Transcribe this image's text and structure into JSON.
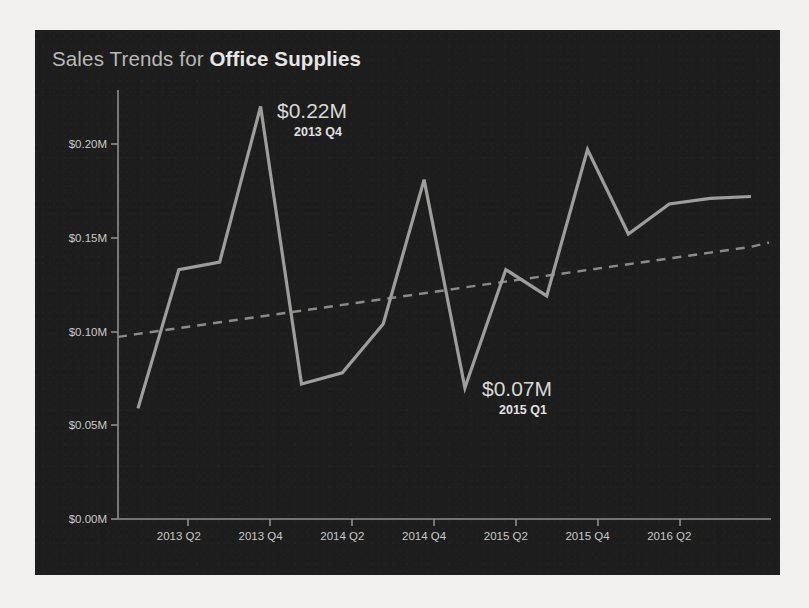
{
  "page": {
    "background_color": "#f1f0ee",
    "panel_color": "#1d1d1d"
  },
  "header": {
    "title_prefix": "Sales Trends for ",
    "title_category": "Office Supplies"
  },
  "colors": {
    "line": "#9d9d9b",
    "trend": "#8a8a88",
    "axis": "#8e8e8c",
    "text": "#c9c9c7",
    "title": "#b9b9b7"
  },
  "annotations": [
    {
      "name": "peak-annotation",
      "value_label": "$0.22M",
      "period_label": "2013 Q4",
      "x": 277,
      "y": 100
    },
    {
      "name": "low-annotation",
      "value_label": "$0.07M",
      "period_label": "2015 Q1",
      "x": 482,
      "y": 378
    }
  ],
  "chart_data": {
    "type": "line",
    "title": "Sales Trends for Office Supplies",
    "xlabel": "",
    "ylabel": "",
    "ylim": [
      0,
      0.225
    ],
    "ytick_values": [
      0.0,
      0.05,
      0.1,
      0.15,
      0.2
    ],
    "ytick_labels": [
      "$0.00M",
      "$0.05M",
      "$0.10M",
      "$0.15M",
      "$0.20M"
    ],
    "xtick_labels": [
      "2013 Q2",
      "2013 Q4",
      "2014 Q2",
      "2014 Q4",
      "2015 Q2",
      "2015 Q4",
      "2016 Q2"
    ],
    "x": [
      "2013 Q1",
      "2013 Q2",
      "2013 Q3",
      "2013 Q4",
      "2014 Q1",
      "2014 Q2",
      "2014 Q3",
      "2014 Q4",
      "2015 Q1",
      "2015 Q2",
      "2015 Q3",
      "2015 Q4",
      "2016 Q1",
      "2016 Q2",
      "2016 Q3",
      "2016 Q4"
    ],
    "series": [
      {
        "name": "Sales",
        "style": "solid",
        "values": [
          0.059,
          0.133,
          0.137,
          0.22,
          0.072,
          0.078,
          0.104,
          0.181,
          0.07,
          0.133,
          0.119,
          0.197,
          0.152,
          0.168,
          0.171,
          0.172
        ]
      },
      {
        "name": "Trend",
        "style": "dashed",
        "values": [
          0.0987,
          0.1018,
          0.1049,
          0.108,
          0.1111,
          0.1142,
          0.1173,
          0.1204,
          0.1235,
          0.1266,
          0.1297,
          0.1328,
          0.1359,
          0.139,
          0.1421,
          0.1452
        ]
      }
    ],
    "grid": false,
    "legend": "none",
    "peak": {
      "label": "$0.22M",
      "period": "2013 Q4",
      "value": 0.22
    },
    "low": {
      "label": "$0.07M",
      "period": "2015 Q1",
      "value": 0.07
    }
  }
}
